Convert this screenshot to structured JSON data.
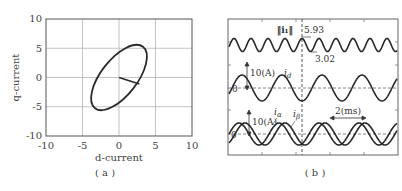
{
  "chart_data": [
    {
      "id": "a",
      "type": "line",
      "title": "",
      "caption": "( a )",
      "xlabel": "d-current",
      "ylabel": "q-current",
      "xlim": [
        -10,
        10
      ],
      "ylim": [
        -10,
        10
      ],
      "xticks": [
        "-10",
        "-5",
        "0",
        "5",
        "10"
      ],
      "yticks": [
        "10",
        "5",
        "0",
        "-5",
        "-10"
      ],
      "grid": true,
      "series": [
        {
          "name": "current locus (ellipse)",
          "description": "tilted ellipse centered at origin",
          "points": [
            [
              2.0,
              5.3
            ],
            [
              4.0,
              3.0
            ],
            [
              2.8,
              -1.1
            ],
            [
              0.5,
              -3.8
            ],
            [
              -2.5,
              -5.5
            ],
            [
              -4.0,
              -3.5
            ],
            [
              -3.0,
              1.0
            ],
            [
              0.0,
              4.2
            ]
          ]
        },
        {
          "name": "current vector",
          "points": [
            [
              0,
              0
            ],
            [
              2.8,
              -1.1
            ]
          ]
        }
      ]
    },
    {
      "id": "b",
      "type": "line",
      "title": "",
      "caption": "( b )",
      "xlabel": "",
      "ylabel": "",
      "grid": false,
      "annotations": {
        "norm_label": "‖i₁‖",
        "norm_max": "5.93",
        "norm_min": "3.02",
        "id_label": "i",
        "id_sub": "d",
        "ia_label": "i",
        "ia_sub": "α",
        "ib_label": "i",
        "ib_sub": "β",
        "scale_id": "10(A)",
        "scale_iab": "10(A)",
        "zero_id": "0",
        "zero_iab": "0",
        "time_scale": "2(ms)"
      },
      "series": [
        {
          "name": "‖i₁‖",
          "max": 5.93,
          "min": 3.02,
          "period_ms": 0.85
        },
        {
          "name": "i_d",
          "amplitude_A": 8,
          "period_ms": 2.0
        },
        {
          "name": "i_α",
          "amplitude_A": 6,
          "period_ms": 2.0
        },
        {
          "name": "i_β",
          "amplitude_A": 6,
          "period_ms": 2.0
        }
      ]
    }
  ]
}
